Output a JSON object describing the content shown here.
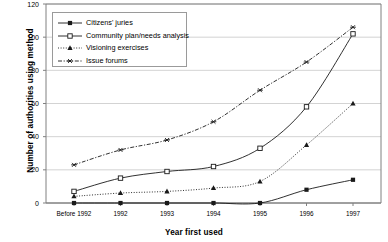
{
  "chart_data": {
    "type": "line",
    "title": "",
    "xlabel": "Year first used",
    "ylabel": "Number of authorities using method",
    "categories": [
      "Before 1992",
      "1992",
      "1993",
      "1994",
      "1995",
      "1996",
      "1997"
    ],
    "ylim": [
      0,
      120
    ],
    "yticks": [
      0,
      20,
      40,
      60,
      80,
      100,
      120
    ],
    "grid": true,
    "legend_position": "upper-left-inside",
    "series": [
      {
        "name": "Citizens' juries",
        "marker": "filled-square",
        "line_style": "solid",
        "values": [
          0,
          0,
          0,
          0,
          0,
          8,
          14
        ]
      },
      {
        "name": "Community plan/needs analysis",
        "marker": "open-square",
        "line_style": "solid",
        "values": [
          7,
          15,
          19,
          22,
          33,
          58,
          102
        ]
      },
      {
        "name": "Visioning exercises",
        "marker": "filled-triangle",
        "line_style": "dotted",
        "values": [
          4,
          6,
          7,
          9,
          13,
          35,
          60
        ]
      },
      {
        "name": "Issue forums",
        "marker": "star",
        "line_style": "dashed",
        "values": [
          23,
          32,
          38,
          49,
          68,
          85,
          106
        ]
      }
    ]
  },
  "axis": {
    "y_title": "Number of authorities using method",
    "x_title": "Year first used",
    "ytick_labels": [
      "120",
      "100",
      "80",
      "60",
      "40",
      "20",
      "0"
    ],
    "xtick_labels": [
      "Before 1992",
      "1992",
      "1993",
      "1994",
      "1995",
      "1996",
      "1997"
    ]
  },
  "legend": {
    "items": [
      {
        "label": "Citizens' juries"
      },
      {
        "label": "Community plan/needs analysis"
      },
      {
        "label": "Visioning exercises"
      },
      {
        "label": "Issue forums"
      }
    ]
  },
  "colors": {
    "line": "#1a1a1a",
    "grid": "#c8c8c8",
    "axis": "#808080",
    "background": "#ffffff"
  }
}
